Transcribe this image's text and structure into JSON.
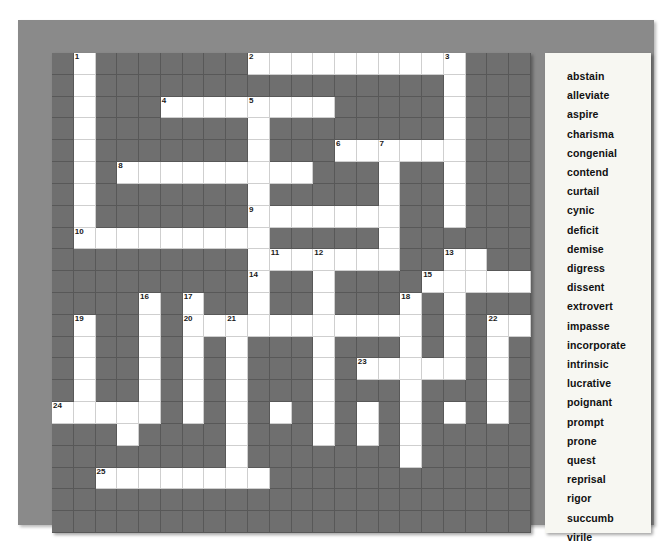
{
  "puzzle": {
    "type": "crossword-word-search",
    "grid": {
      "columns": 22,
      "rows": 22,
      "block_color": "#6f6f6f",
      "open_color": "#ffffff",
      "open_cells": [
        [
          0,
          1
        ],
        [
          0,
          9
        ],
        [
          0,
          10
        ],
        [
          0,
          11
        ],
        [
          0,
          12
        ],
        [
          0,
          13
        ],
        [
          0,
          14
        ],
        [
          0,
          15
        ],
        [
          0,
          16
        ],
        [
          0,
          17
        ],
        [
          0,
          18
        ],
        [
          1,
          1
        ],
        [
          1,
          18
        ],
        [
          2,
          1
        ],
        [
          2,
          5
        ],
        [
          2,
          6
        ],
        [
          2,
          7
        ],
        [
          2,
          8
        ],
        [
          2,
          9
        ],
        [
          2,
          10
        ],
        [
          2,
          11
        ],
        [
          2,
          12
        ],
        [
          2,
          18
        ],
        [
          3,
          1
        ],
        [
          3,
          9
        ],
        [
          3,
          18
        ],
        [
          4,
          1
        ],
        [
          4,
          9
        ],
        [
          4,
          13
        ],
        [
          4,
          14
        ],
        [
          4,
          15
        ],
        [
          4,
          16
        ],
        [
          4,
          17
        ],
        [
          4,
          18
        ],
        [
          5,
          1
        ],
        [
          5,
          3
        ],
        [
          5,
          4
        ],
        [
          5,
          5
        ],
        [
          5,
          6
        ],
        [
          5,
          7
        ],
        [
          5,
          8
        ],
        [
          5,
          9
        ],
        [
          5,
          10
        ],
        [
          5,
          11
        ],
        [
          5,
          15
        ],
        [
          5,
          18
        ],
        [
          6,
          1
        ],
        [
          6,
          9
        ],
        [
          6,
          15
        ],
        [
          6,
          18
        ],
        [
          7,
          1
        ],
        [
          7,
          9
        ],
        [
          7,
          10
        ],
        [
          7,
          11
        ],
        [
          7,
          12
        ],
        [
          7,
          13
        ],
        [
          7,
          14
        ],
        [
          7,
          15
        ],
        [
          7,
          18
        ],
        [
          8,
          1
        ],
        [
          8,
          2
        ],
        [
          8,
          3
        ],
        [
          8,
          4
        ],
        [
          8,
          5
        ],
        [
          8,
          6
        ],
        [
          8,
          7
        ],
        [
          8,
          8
        ],
        [
          8,
          9
        ],
        [
          8,
          15
        ],
        [
          9,
          9
        ],
        [
          9,
          10
        ],
        [
          9,
          11
        ],
        [
          9,
          12
        ],
        [
          9,
          13
        ],
        [
          9,
          14
        ],
        [
          9,
          15
        ],
        [
          9,
          18
        ],
        [
          9,
          19
        ],
        [
          10,
          9
        ],
        [
          10,
          12
        ],
        [
          10,
          17
        ],
        [
          10,
          18
        ],
        [
          10,
          19
        ],
        [
          10,
          20
        ],
        [
          10,
          21
        ],
        [
          11,
          4
        ],
        [
          11,
          6
        ],
        [
          11,
          9
        ],
        [
          11,
          12
        ],
        [
          11,
          16
        ],
        [
          11,
          18
        ],
        [
          12,
          1
        ],
        [
          12,
          4
        ],
        [
          12,
          6
        ],
        [
          12,
          7
        ],
        [
          12,
          8
        ],
        [
          12,
          9
        ],
        [
          12,
          10
        ],
        [
          12,
          11
        ],
        [
          12,
          12
        ],
        [
          12,
          13
        ],
        [
          12,
          14
        ],
        [
          12,
          15
        ],
        [
          12,
          16
        ],
        [
          12,
          18
        ],
        [
          12,
          20
        ],
        [
          12,
          21
        ],
        [
          13,
          1
        ],
        [
          13,
          4
        ],
        [
          13,
          6
        ],
        [
          13,
          8
        ],
        [
          13,
          12
        ],
        [
          13,
          16
        ],
        [
          13,
          18
        ],
        [
          13,
          20
        ],
        [
          14,
          1
        ],
        [
          14,
          4
        ],
        [
          14,
          6
        ],
        [
          14,
          8
        ],
        [
          14,
          12
        ],
        [
          14,
          14
        ],
        [
          14,
          15
        ],
        [
          14,
          16
        ],
        [
          14,
          17
        ],
        [
          14,
          18
        ],
        [
          14,
          20
        ],
        [
          15,
          1
        ],
        [
          15,
          4
        ],
        [
          15,
          6
        ],
        [
          15,
          8
        ],
        [
          15,
          12
        ],
        [
          15,
          16
        ],
        [
          15,
          20
        ],
        [
          16,
          0
        ],
        [
          16,
          1
        ],
        [
          16,
          2
        ],
        [
          16,
          3
        ],
        [
          16,
          4
        ],
        [
          16,
          6
        ],
        [
          16,
          8
        ],
        [
          16,
          10
        ],
        [
          16,
          12
        ],
        [
          16,
          14
        ],
        [
          16,
          16
        ],
        [
          16,
          18
        ],
        [
          16,
          20
        ],
        [
          17,
          3
        ],
        [
          17,
          8
        ],
        [
          17,
          12
        ],
        [
          17,
          14
        ],
        [
          17,
          16
        ],
        [
          18,
          8
        ],
        [
          18,
          16
        ],
        [
          19,
          2
        ],
        [
          19,
          3
        ],
        [
          19,
          4
        ],
        [
          19,
          5
        ],
        [
          19,
          6
        ],
        [
          19,
          7
        ],
        [
          19,
          8
        ],
        [
          19,
          9
        ],
        [
          20,
          -1
        ],
        [
          21,
          -1
        ]
      ],
      "numbers": [
        {
          "n": 1,
          "row": 0,
          "col": 1
        },
        {
          "n": 2,
          "row": 0,
          "col": 9
        },
        {
          "n": 3,
          "row": 0,
          "col": 18
        },
        {
          "n": 4,
          "row": 2,
          "col": 5
        },
        {
          "n": 5,
          "row": 2,
          "col": 9
        },
        {
          "n": 6,
          "row": 4,
          "col": 13
        },
        {
          "n": 7,
          "row": 4,
          "col": 15
        },
        {
          "n": 8,
          "row": 5,
          "col": 3
        },
        {
          "n": 9,
          "row": 7,
          "col": 9
        },
        {
          "n": 10,
          "row": 8,
          "col": 1
        },
        {
          "n": 11,
          "row": 9,
          "col": 10
        },
        {
          "n": 12,
          "row": 9,
          "col": 12
        },
        {
          "n": 13,
          "row": 9,
          "col": 18
        },
        {
          "n": 14,
          "row": 10,
          "col": 9
        },
        {
          "n": 15,
          "row": 10,
          "col": 17
        },
        {
          "n": 16,
          "row": 11,
          "col": 4
        },
        {
          "n": 17,
          "row": 11,
          "col": 6
        },
        {
          "n": 18,
          "row": 11,
          "col": 16
        },
        {
          "n": 19,
          "row": 12,
          "col": 1
        },
        {
          "n": 20,
          "row": 12,
          "col": 6
        },
        {
          "n": 21,
          "row": 12,
          "col": 8
        },
        {
          "n": 22,
          "row": 12,
          "col": 20
        },
        {
          "n": 23,
          "row": 14,
          "col": 14
        },
        {
          "n": 24,
          "row": 16,
          "col": 0
        },
        {
          "n": 25,
          "row": 19,
          "col": 2
        }
      ]
    },
    "wordlist": {
      "title": "",
      "words": [
        "abstain",
        "alleviate",
        "aspire",
        "charisma",
        "congenial",
        "contend",
        "curtail",
        "cynic",
        "deficit",
        "demise",
        "digress",
        "dissent",
        "extrovert",
        "impasse",
        "incorporate",
        "intrinsic",
        "lucrative",
        "poignant",
        "prompt",
        "prone",
        "quest",
        "reprisal",
        "rigor",
        "succumb",
        "virile"
      ]
    }
  }
}
